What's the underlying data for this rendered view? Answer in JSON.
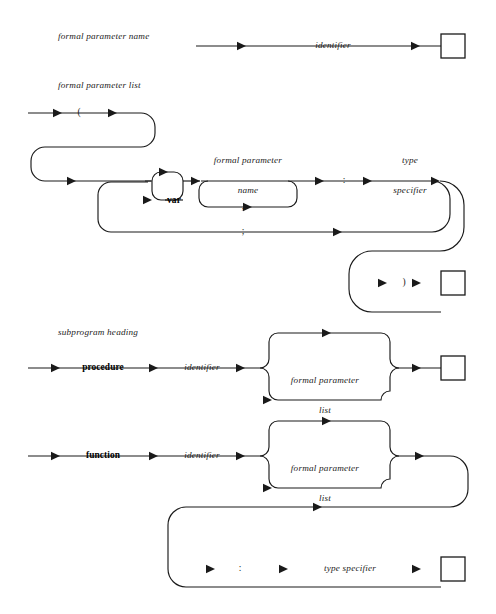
{
  "figure": {
    "kind": "railroad-syntax-diagram",
    "language": "Pascal",
    "background": "#ffffff",
    "ink": "#1a1a1a",
    "width": 496,
    "height": 614
  },
  "sections": [
    {
      "id": "formal-parameter-name",
      "heading": "formal parameter name",
      "nodes": [
        {
          "id": "identifier",
          "text": "identifier",
          "style": "nonterminal"
        }
      ]
    },
    {
      "id": "formal-parameter-list",
      "heading": "formal parameter list",
      "nodes": [
        {
          "id": "lparen",
          "text": "(",
          "style": "terminal-punct"
        },
        {
          "id": "var",
          "text": "var",
          "style": "keyword"
        },
        {
          "id": "fpname",
          "text": "formal parameter\nname",
          "style": "nonterminal"
        },
        {
          "id": "comma",
          "text": ",",
          "style": "terminal-punct"
        },
        {
          "id": "semicolon",
          "text": ";",
          "style": "terminal-punct"
        },
        {
          "id": "colon",
          "text": ":",
          "style": "terminal-punct"
        },
        {
          "id": "typespec",
          "text": "type\nspecifier",
          "style": "nonterminal"
        },
        {
          "id": "rparen",
          "text": ")",
          "style": "terminal-punct"
        }
      ]
    },
    {
      "id": "subprogram-heading",
      "heading": "subprogram heading",
      "nodes": [
        {
          "id": "procedure",
          "text": "procedure",
          "style": "keyword"
        },
        {
          "id": "proc-identifier",
          "text": "identifier",
          "style": "nonterminal"
        },
        {
          "id": "proc-fplist",
          "text": "formal parameter\nlist",
          "style": "nonterminal"
        },
        {
          "id": "function",
          "text": "function",
          "style": "keyword"
        },
        {
          "id": "func-identifier",
          "text": "identifier",
          "style": "nonterminal"
        },
        {
          "id": "func-fplist",
          "text": "formal parameter\nlist",
          "style": "nonterminal"
        },
        {
          "id": "func-colon",
          "text": ":",
          "style": "terminal-punct"
        },
        {
          "id": "func-typespec",
          "text": "type specifier",
          "style": "nonterminal"
        }
      ]
    }
  ],
  "labels": {
    "heading_fpn": "formal parameter name",
    "heading_fpl": "formal parameter list",
    "heading_sph": "subprogram heading",
    "identifier": "identifier",
    "lparen": "(",
    "rparen": ")",
    "var": "var",
    "fpname_l1": "formal parameter",
    "fpname_l2": "name",
    "comma": ",",
    "semicolon": ";",
    "colon": ":",
    "typespec_l1": "type",
    "typespec_l2": "specifier",
    "procedure": "procedure",
    "proc_identifier": "identifier",
    "fplist_l1": "formal parameter",
    "fplist_l2": "list",
    "function": "function",
    "func_identifier": "identifier",
    "func_colon": ":",
    "func_typespec": "type specifier"
  }
}
